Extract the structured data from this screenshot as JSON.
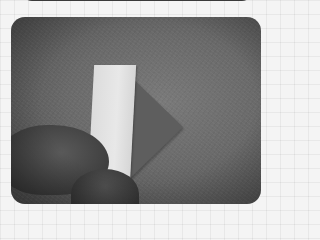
{
  "image": {
    "description": "Grayscale photo of an origami folding step: a hand holding a folded paper strip with a triangular flap on a textured surface",
    "style": "grayscale",
    "colors": {
      "background_grid": "#f4f4f4",
      "surface": "#6a6a6a",
      "paper_light": "#e0e0e0",
      "paper_dark": "#5e5e5e",
      "hand": "#3e3e3e"
    }
  }
}
